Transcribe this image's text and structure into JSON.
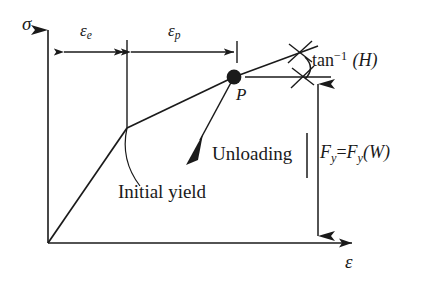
{
  "figure": {
    "axes": {
      "y_axis_label": "σ",
      "x_axis_label": "ε",
      "y_axis_name": "stress-axis",
      "x_axis_name": "strain-axis"
    },
    "dimensions": [
      {
        "id": "elastic-strain",
        "label_base": "ε",
        "label_sub": "e",
        "description": "elastic strain extent"
      },
      {
        "id": "plastic-strain",
        "label_base": "ε",
        "label_sub": "p",
        "description": "plastic strain extent"
      }
    ],
    "annotations": {
      "point_label": "P",
      "initial_yield": "Initial yield",
      "unloading": "Unloading",
      "tangent_modulus": {
        "fn": "tan",
        "exponent": "−1",
        "arg": "(H)"
      },
      "yield_force": {
        "f": "F",
        "sub1": "y",
        "eq": "=",
        "f2": "F",
        "sub2": "y",
        "arg": "(W)"
      }
    },
    "colors": {
      "ink": "#1a1a1a",
      "background": "#ffffff"
    }
  }
}
